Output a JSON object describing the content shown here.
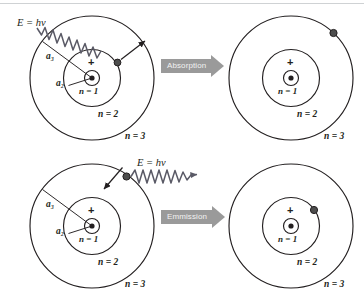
{
  "figure": {
    "colors": {
      "line": "#231f20",
      "arrow_fill": "#9a9a9a",
      "arrow_text": "#f2f2f2",
      "electron": "#4d4d4d",
      "wave": "#5a5a66",
      "top_rule": "#cfd2d4",
      "background": "#ffffff"
    }
  },
  "rows": [
    {
      "id": "absorption",
      "process_label": "Absorption",
      "photon_label": "E = hv",
      "before": {
        "id": "atom-absorption-before",
        "shell_labels": [
          "n = 1",
          "n = 2",
          "n = 3"
        ],
        "radius_labels": [
          "a₂",
          "a₃"
        ],
        "nucleus_charge": "+",
        "electron_shell": "n = 2"
      },
      "after": {
        "id": "atom-absorption-after",
        "shell_labels": [
          "n = 1",
          "n = 2",
          "n = 3"
        ],
        "nucleus_charge": "+",
        "electron_shell": "n = 3"
      }
    },
    {
      "id": "emission",
      "process_label": "Emmission",
      "photon_label": "E = hv",
      "before": {
        "id": "atom-emission-before",
        "shell_labels": [
          "n = 1",
          "n = 2",
          "n = 3"
        ],
        "radius_labels": [
          "a₂",
          "a₃"
        ],
        "nucleus_charge": "+",
        "electron_shell": "n = 3"
      },
      "after": {
        "id": "atom-emission-after",
        "shell_labels": [
          "n = 1",
          "n = 2",
          "n = 3"
        ],
        "nucleus_charge": "+",
        "electron_shell": "n = 2"
      }
    }
  ]
}
